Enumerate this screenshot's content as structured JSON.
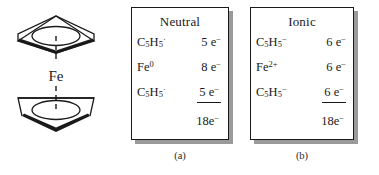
{
  "figure": {
    "structure": {
      "name": "ferrocene",
      "metal_label": "Fe",
      "ring_label": "cyclopentadienyl-ring",
      "bond_style": "dashed"
    },
    "boxes": [
      {
        "id": "neutral",
        "title": "Neutral",
        "caption": "(a)",
        "rows": [
          {
            "species_base": "C",
            "species_sub1": "5",
            "species_mid": "H",
            "species_sub2": "5",
            "species_sup": "·",
            "count_value": "5 e",
            "count_sup": "−",
            "ruled": false
          },
          {
            "species_base": "Fe",
            "species_sub1": "",
            "species_mid": "",
            "species_sub2": "",
            "species_sup": "0",
            "count_value": "8 e",
            "count_sup": "−",
            "ruled": false
          },
          {
            "species_base": "C",
            "species_sub1": "5",
            "species_mid": "H",
            "species_sub2": "5",
            "species_sup": "·",
            "count_value": "5 e",
            "count_sup": "−",
            "ruled": true
          }
        ],
        "total_value": "18e",
        "total_sup": "−"
      },
      {
        "id": "ionic",
        "title": "Ionic",
        "caption": "(b)",
        "rows": [
          {
            "species_base": "C",
            "species_sub1": "5",
            "species_mid": "H",
            "species_sub2": "5",
            "species_sup": "−",
            "count_value": "6 e",
            "count_sup": "−",
            "ruled": false
          },
          {
            "species_base": "Fe",
            "species_sub1": "",
            "species_mid": "",
            "species_sub2": "",
            "species_sup": "2+",
            "count_value": "6 e",
            "count_sup": "−",
            "ruled": false
          },
          {
            "species_base": "C",
            "species_sub1": "5",
            "species_mid": "H",
            "species_sub2": "5",
            "species_sup": "−",
            "count_value": "6 e",
            "count_sup": "−",
            "ruled": true
          }
        ],
        "total_value": "18e",
        "total_sup": "−"
      }
    ]
  },
  "colors": {
    "ink": "#1a1a1a",
    "shadow": "#9a9a9a",
    "background": "#ffffff"
  }
}
